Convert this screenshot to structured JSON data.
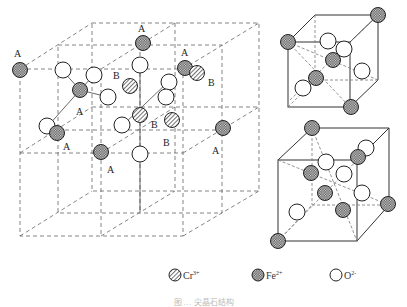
{
  "figure": {
    "caption": "图 … 尖晶石结构"
  },
  "main_cube": {
    "site_labels": [
      {
        "text": "A",
        "x": 19,
        "y": 55
      },
      {
        "text": "A",
        "x": 142,
        "y": 31
      },
      {
        "text": "A",
        "x": 184,
        "y": 55
      },
      {
        "text": "B",
        "x": 117,
        "y": 75
      },
      {
        "text": "B",
        "x": 210,
        "y": 85
      },
      {
        "text": "A",
        "x": 80,
        "y": 112
      },
      {
        "text": "A",
        "x": 66,
        "y": 149
      },
      {
        "text": "B",
        "x": 154,
        "y": 127
      },
      {
        "text": "B",
        "x": 165,
        "y": 145
      },
      {
        "text": "A",
        "x": 110,
        "y": 172
      },
      {
        "text": "A",
        "x": 215,
        "y": 152
      }
    ]
  },
  "legend": {
    "items": [
      {
        "symbol": "hatched-circle",
        "label": "Cr",
        "charge": "3+"
      },
      {
        "symbol": "crosshatched-circle",
        "label": "Fe",
        "charge": "2+"
      },
      {
        "symbol": "open-circle",
        "label": "O",
        "charge": "2-"
      }
    ]
  },
  "colors": {
    "line": "#444444",
    "dash": "#666666",
    "atom_stroke": "#222222",
    "background": "#ffffff"
  }
}
